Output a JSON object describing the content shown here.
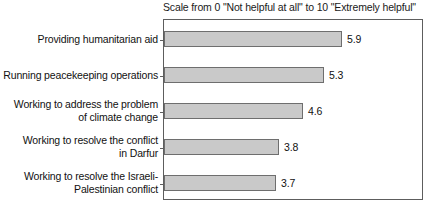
{
  "chart_data": {
    "type": "bar",
    "orientation": "horizontal",
    "title": "Scale from 0 \"Not helpful at all\" to 10 \"Extremely helpful\"",
    "xlabel": "",
    "ylabel": "",
    "xlim": [
      0,
      10
    ],
    "grid": false,
    "legend": null,
    "categories": [
      "Providing humanitarian aid",
      "Running peacekeeping operations",
      "Working to address the problem of climate change",
      "Working to resolve the conflict in Darfur",
      "Working to resolve the Israeli-Palestinian conflict"
    ],
    "category_lines": [
      [
        "Providing humanitarian aid"
      ],
      [
        "Running peacekeeping operations"
      ],
      [
        "Working to address the problem",
        "of climate change"
      ],
      [
        "Working to resolve the conflict",
        "in Darfur"
      ],
      [
        "Working to resolve the Israeli-",
        "Palestinian conflict"
      ]
    ],
    "values": [
      5.9,
      5.3,
      4.6,
      3.8,
      3.7
    ],
    "value_labels": [
      "5.9",
      "5.3",
      "4.6",
      "3.8",
      "3.7"
    ],
    "colors": {
      "bar_fill": "#c9c9c9",
      "bar_border": "#6e6e6e",
      "frame": "#5d5d5d",
      "text": "#111111",
      "background": "#ffffff"
    }
  }
}
